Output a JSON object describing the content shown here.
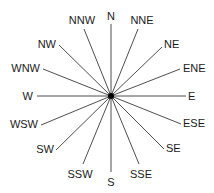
{
  "diagram": {
    "type": "compass-rose",
    "center": {
      "x": 111,
      "y": 96
    },
    "colors": {
      "line": "#3a3a3a",
      "text": "#1a1a1a",
      "center_dot": "#000000",
      "background": "#ffffff"
    },
    "points": [
      {
        "label": "N",
        "angle": 0,
        "x2": 111,
        "y2": 24,
        "lx": 111,
        "ly": 20,
        "anchor": "middle"
      },
      {
        "label": "NNE",
        "angle": 22.5,
        "x2": 138,
        "y2": 29,
        "lx": 142,
        "ly": 24,
        "anchor": "middle"
      },
      {
        "label": "NE",
        "angle": 45,
        "x2": 162,
        "y2": 47,
        "lx": 164,
        "ly": 48,
        "anchor": "start"
      },
      {
        "label": "ENE",
        "angle": 67.5,
        "x2": 180,
        "y2": 69,
        "lx": 183,
        "ly": 72,
        "anchor": "start"
      },
      {
        "label": "E",
        "angle": 90,
        "x2": 186,
        "y2": 96,
        "lx": 188,
        "ly": 100,
        "anchor": "start"
      },
      {
        "label": "ESE",
        "angle": 112.5,
        "x2": 181,
        "y2": 124,
        "lx": 183,
        "ly": 127,
        "anchor": "start"
      },
      {
        "label": "SE",
        "angle": 135,
        "x2": 164,
        "y2": 149,
        "lx": 166,
        "ly": 152,
        "anchor": "start"
      },
      {
        "label": "SSE",
        "angle": 157.5,
        "x2": 139,
        "y2": 164,
        "lx": 141,
        "ly": 178,
        "anchor": "middle"
      },
      {
        "label": "S",
        "angle": 180,
        "x2": 111,
        "y2": 172,
        "lx": 111,
        "ly": 186,
        "anchor": "middle"
      },
      {
        "label": "SSW",
        "angle": 202.5,
        "x2": 83,
        "y2": 164,
        "lx": 80,
        "ly": 178,
        "anchor": "middle"
      },
      {
        "label": "SW",
        "angle": 225,
        "x2": 56,
        "y2": 150,
        "lx": 54,
        "ly": 153,
        "anchor": "end"
      },
      {
        "label": "WSW",
        "angle": 247.5,
        "x2": 41,
        "y2": 125,
        "lx": 38,
        "ly": 128,
        "anchor": "end"
      },
      {
        "label": "W",
        "angle": 270,
        "x2": 37,
        "y2": 96,
        "lx": 33,
        "ly": 100,
        "anchor": "end"
      },
      {
        "label": "WNW",
        "angle": 292.5,
        "x2": 43,
        "y2": 69,
        "lx": 40,
        "ly": 72,
        "anchor": "end"
      },
      {
        "label": "NW",
        "angle": 315,
        "x2": 59,
        "y2": 45,
        "lx": 56,
        "ly": 48,
        "anchor": "end"
      },
      {
        "label": "NNW",
        "angle": 337.5,
        "x2": 84,
        "y2": 29,
        "lx": 82,
        "ly": 24,
        "anchor": "middle"
      }
    ]
  }
}
